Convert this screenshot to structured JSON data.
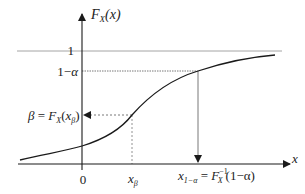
{
  "diagram": {
    "y_axis_label": {
      "main": "F",
      "sub": "X",
      "rest": "(x)"
    },
    "x_axis_label": "x",
    "origin_label": "0",
    "level_one_label": "1",
    "level_alpha_label": {
      "a": "1−",
      "b": "α"
    },
    "beta_label": {
      "beta": "β",
      "eq": " = ",
      "F": "F",
      "sub": "X",
      "open": "(",
      "x": "x",
      "xsub": "β",
      "close": ")"
    },
    "x_beta_label": {
      "x": "x",
      "sub": "β"
    },
    "x_alpha_label": {
      "x": "x",
      "sub": "1−α",
      "eq": " = ",
      "F": "F",
      "sup": "−1",
      "sub2": "X",
      "arg": "(1−α)"
    },
    "colors": {
      "axis": "#1a1a1a",
      "curve": "#1a1a1a",
      "asymptote": "#9a9a9a",
      "guide": "#555555"
    }
  }
}
